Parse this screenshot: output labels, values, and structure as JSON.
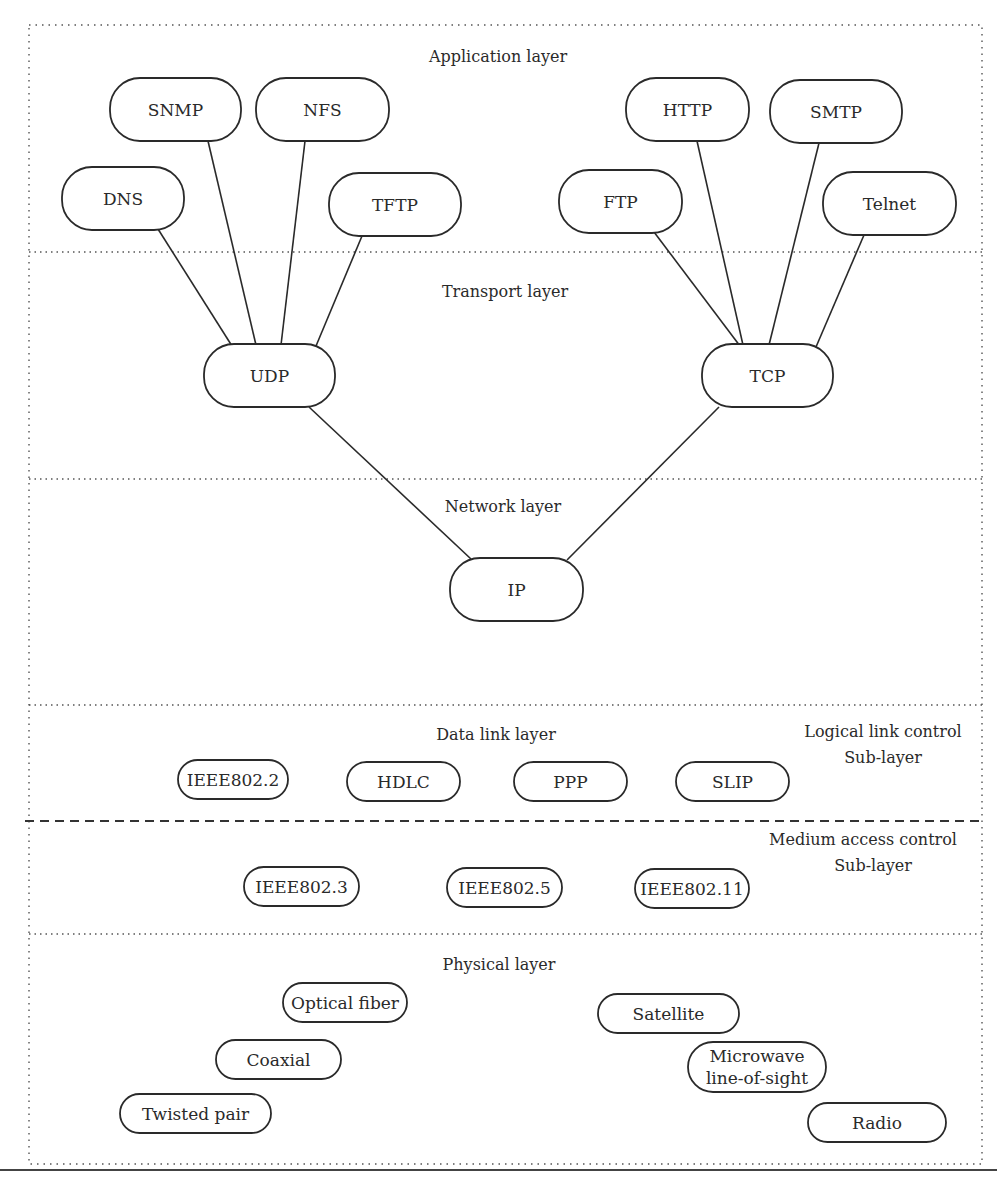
{
  "layers": {
    "application": {
      "title": "Application layer"
    },
    "transport": {
      "title": "Transport layer"
    },
    "network": {
      "title": "Network layer"
    },
    "datalink": {
      "title": "Data link layer",
      "llc_sublayer": [
        "Logical link control",
        "Sub-layer"
      ],
      "mac_sublayer": [
        "Medium access control",
        "Sub-layer"
      ]
    },
    "physical": {
      "title": "Physical layer"
    }
  },
  "nodes": {
    "snmp": {
      "label": [
        "SNMP"
      ]
    },
    "nfs": {
      "label": [
        "NFS"
      ]
    },
    "dns": {
      "label": [
        "DNS"
      ]
    },
    "tftp": {
      "label": [
        "TFTP"
      ]
    },
    "http": {
      "label": [
        "HTTP"
      ]
    },
    "smtp": {
      "label": [
        "SMTP"
      ]
    },
    "ftp": {
      "label": [
        "FTP"
      ]
    },
    "telnet": {
      "label": [
        "Telnet"
      ]
    },
    "udp": {
      "label": [
        "UDP"
      ]
    },
    "tcp": {
      "label": [
        "TCP"
      ]
    },
    "ip": {
      "label": [
        "IP"
      ]
    },
    "ieee802_2": {
      "label": [
        "IEEE802.2"
      ]
    },
    "hdlc": {
      "label": [
        "HDLC"
      ]
    },
    "ppp": {
      "label": [
        "PPP"
      ]
    },
    "slip": {
      "label": [
        "SLIP"
      ]
    },
    "ieee802_3": {
      "label": [
        "IEEE802.3"
      ]
    },
    "ieee802_5": {
      "label": [
        "IEEE802.5"
      ]
    },
    "ieee802_11": {
      "label": [
        "IEEE802.11"
      ]
    },
    "optical_fiber": {
      "label": [
        "Optical fiber"
      ]
    },
    "coaxial": {
      "label": [
        "Coaxial"
      ]
    },
    "twisted_pair": {
      "label": [
        "Twisted pair"
      ]
    },
    "satellite": {
      "label": [
        "Satellite"
      ]
    },
    "microwave": {
      "label": [
        "Microwave",
        "line-of-sight"
      ]
    },
    "radio": {
      "label": [
        "Radio"
      ]
    }
  },
  "edges": [
    {
      "from": "dns",
      "to": "udp"
    },
    {
      "from": "snmp",
      "to": "udp"
    },
    {
      "from": "nfs",
      "to": "udp"
    },
    {
      "from": "tftp",
      "to": "udp"
    },
    {
      "from": "ftp",
      "to": "tcp"
    },
    {
      "from": "http",
      "to": "tcp"
    },
    {
      "from": "smtp",
      "to": "tcp"
    },
    {
      "from": "telnet",
      "to": "tcp"
    },
    {
      "from": "udp",
      "to": "ip"
    },
    {
      "from": "tcp",
      "to": "ip"
    }
  ]
}
